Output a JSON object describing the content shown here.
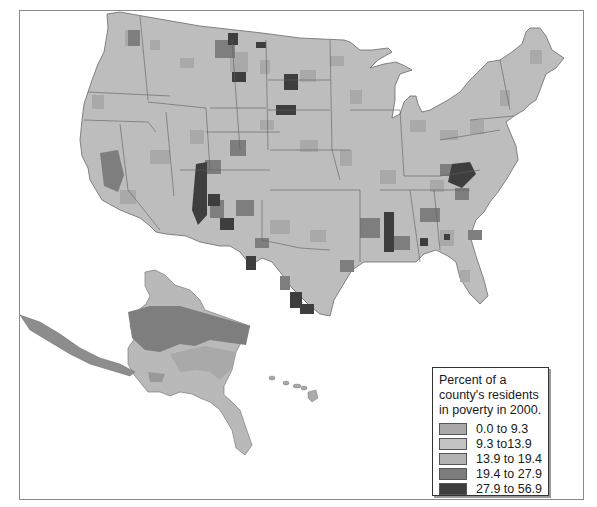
{
  "map": {
    "subject": "Percent of county residents in poverty, United States, 2000",
    "regions_shown": [
      "Contiguous United States",
      "Alaska",
      "Hawaii"
    ]
  },
  "legend": {
    "title": "Percent of a county's residents in poverty in 2000.",
    "classes": [
      {
        "label": "0.0 to 9.3",
        "color": "#a9a9a9"
      },
      {
        "label": "9.3 to13.9",
        "color": "#c4c4c4"
      },
      {
        "label": "13.9 to 19.4",
        "color": "#b3b3b3"
      },
      {
        "label": "19.4 to 27.9",
        "color": "#7d7d7d"
      },
      {
        "label": "27.9 to 56.9",
        "color": "#3e3e3e"
      }
    ]
  },
  "colors": {
    "base": "#bdbdbd",
    "mid": "#a8a8a8",
    "high": "#7f7f7f",
    "highest": "#3f3f3f",
    "borders": "#5a5a5a",
    "frame": "#8a8a8a"
  }
}
